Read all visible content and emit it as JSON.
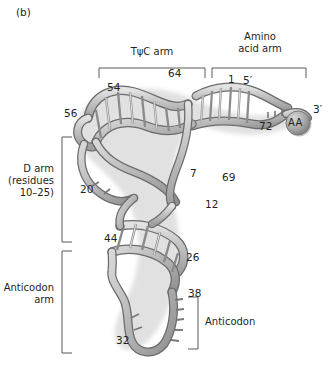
{
  "figure": {
    "panel_id": "(b)",
    "caption_labels": {
      "tpsic_arm": "TψC arm",
      "amino_acid_arm": "Amino\nacid arm",
      "d_arm": "D arm\n(residues\n10–25)",
      "anticodon_arm": "Anticodon\narm",
      "anticodon": "Anticodon"
    },
    "end_labels": {
      "five_prime": "5′",
      "three_prime": "3′",
      "amino_acid_sphere": "AA"
    },
    "residue_numbers": [
      {
        "id": "n54",
        "label": "54",
        "x": 107,
        "y": 82
      },
      {
        "id": "n64",
        "label": "64",
        "x": 168,
        "y": 68
      },
      {
        "id": "n1",
        "label": "1",
        "x": 228,
        "y": 74
      },
      {
        "id": "n56",
        "label": "56",
        "x": 64,
        "y": 108
      },
      {
        "id": "n72",
        "label": "72",
        "x": 259,
        "y": 121
      },
      {
        "id": "n7",
        "label": "7",
        "x": 190,
        "y": 168
      },
      {
        "id": "n69",
        "label": "69",
        "x": 222,
        "y": 172
      },
      {
        "id": "n20",
        "label": "20",
        "x": 80,
        "y": 184
      },
      {
        "id": "n12",
        "label": "12",
        "x": 205,
        "y": 199
      },
      {
        "id": "n44",
        "label": "44",
        "x": 104,
        "y": 233
      },
      {
        "id": "n26",
        "label": "26",
        "x": 186,
        "y": 252
      },
      {
        "id": "n38",
        "label": "38",
        "x": 188,
        "y": 288
      },
      {
        "id": "n32",
        "label": "32",
        "x": 116,
        "y": 335
      }
    ],
    "colors": {
      "ink": "#231f20",
      "bracket": "#58595b",
      "ribbon_fill": "#b3b3b3",
      "ribbon_fill_light": "#d9d9d9",
      "ribbon_stroke": "#5a5a5a",
      "shadow": "#cfcfcf",
      "background": "#ffffff"
    },
    "structure": {
      "type": "tRNA cloverleaf tertiary (L-shape) ribbon model",
      "arms": [
        "TψC arm",
        "Amino acid arm",
        "D arm",
        "Anticodon arm"
      ]
    }
  }
}
